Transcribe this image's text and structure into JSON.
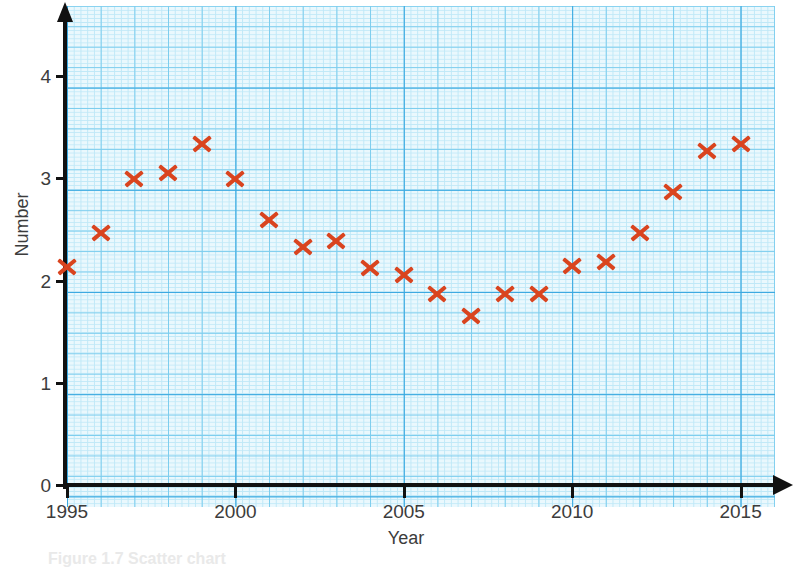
{
  "chart_data": {
    "type": "scatter",
    "title": "",
    "xlabel": "Year",
    "ylabel": "Number",
    "xlim": [
      1994.0,
      2015.0
    ],
    "ylim": [
      0,
      4.5
    ],
    "grid": true,
    "grid_style": "graph-paper",
    "legend": "none",
    "marker": "x",
    "marker_color": "#d9441f",
    "grid_color_major": "#3aa8e0",
    "grid_color_minor": "#7ccdee",
    "grid_background": "#eaf8fd",
    "axis_color": "#111111",
    "xticks": [
      1995,
      2000,
      2005,
      2010,
      2015
    ],
    "xtick_labels": [
      "1995",
      "2000",
      "2005",
      "2010",
      "2015"
    ],
    "yticks": [
      0,
      1,
      2,
      3,
      4
    ],
    "ytick_labels": [
      "0",
      "1",
      "2",
      "3",
      "4"
    ],
    "x": [
      1995,
      1996,
      1997,
      1998,
      1999,
      2000,
      2001,
      2002,
      2003,
      2004,
      2005,
      2006,
      2007,
      2008,
      2009,
      2010,
      2011,
      2012,
      2013,
      2014,
      2015
    ],
    "values": [
      2.14,
      2.47,
      3.0,
      3.06,
      3.34,
      3.0,
      2.6,
      2.33,
      2.39,
      2.13,
      2.06,
      1.87,
      1.66,
      1.87,
      1.87,
      2.15,
      2.19,
      2.47,
      2.87,
      3.27,
      3.34
    ],
    "points": [
      {
        "year": 1995,
        "value": 2.14
      },
      {
        "year": 1996,
        "value": 2.47
      },
      {
        "year": 1997,
        "value": 3.0
      },
      {
        "year": 1998,
        "value": 3.06
      },
      {
        "year": 1999,
        "value": 3.34
      },
      {
        "year": 2000,
        "value": 3.0
      },
      {
        "year": 2001,
        "value": 2.6
      },
      {
        "year": 2002,
        "value": 2.33
      },
      {
        "year": 2003,
        "value": 2.39
      },
      {
        "year": 2004,
        "value": 2.13
      },
      {
        "year": 2005,
        "value": 2.06
      },
      {
        "year": 2006,
        "value": 1.87
      },
      {
        "year": 2007,
        "value": 1.66
      },
      {
        "year": 2008,
        "value": 1.87
      },
      {
        "year": 2009,
        "value": 1.87
      },
      {
        "year": 2010,
        "value": 2.15
      },
      {
        "year": 2011,
        "value": 2.19
      },
      {
        "year": 2012,
        "value": 2.47
      },
      {
        "year": 2013,
        "value": 2.87
      },
      {
        "year": 2014,
        "value": 3.27
      },
      {
        "year": 2015,
        "value": 3.34
      }
    ]
  },
  "axes": {
    "y_title": "Number",
    "x_title": "Year",
    "y_tick_labels": [
      "0",
      "1",
      "2",
      "3",
      "4"
    ],
    "x_tick_labels": [
      "1995",
      "2000",
      "2005",
      "2010",
      "2015"
    ]
  },
  "caption": {
    "text": "Figure 1.7 Scatter chart"
  }
}
